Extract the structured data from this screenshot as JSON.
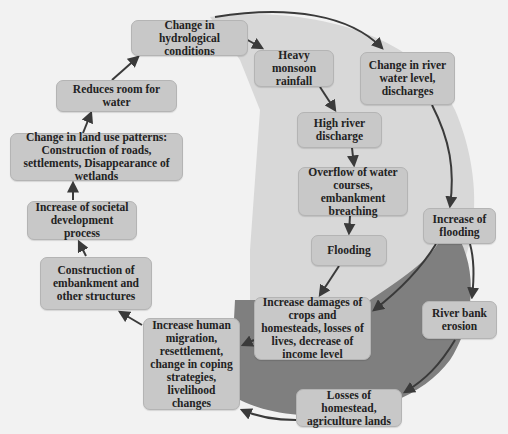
{
  "colors": {
    "background": "#f2f2f2",
    "light_region": "#d8d8d8",
    "dark_region": "#7f7f7f",
    "node_fill": "#c8c8c8",
    "arrow": "#3a3a3a"
  },
  "nodes": [
    {
      "id": "hydrological",
      "label": "Change in hydrological conditions"
    },
    {
      "id": "monsoon",
      "label": "Heavy monsoon rainfall"
    },
    {
      "id": "river_level",
      "label": "Change in river water level, discharges"
    },
    {
      "id": "reduces_room",
      "label": "Reduces room for water"
    },
    {
      "id": "high_discharge",
      "label": "High river discharge"
    },
    {
      "id": "land_use",
      "label": "Change in land use patterns: Construction of roads, settlements, Disappearance of wetlands"
    },
    {
      "id": "overflow",
      "label": "Overflow of water courses, embankment breaching"
    },
    {
      "id": "societal",
      "label": "Increase of societal development process"
    },
    {
      "id": "increase_flooding",
      "label": "Increase of flooding"
    },
    {
      "id": "flooding",
      "label": "Flooding"
    },
    {
      "id": "embankment",
      "label": "Construction of embankment and other structures"
    },
    {
      "id": "bank_erosion",
      "label": "River bank erosion"
    },
    {
      "id": "damages",
      "label": "Increase damages of crops and homesteads, losses of lives, decrease of income level"
    },
    {
      "id": "migration",
      "label": "Increase human migration, resettlement, change in coping strategies, livelihood changes"
    },
    {
      "id": "losses",
      "label": "Losses of homestead, agriculture lands"
    }
  ],
  "edges": [
    [
      "hydrological",
      "monsoon"
    ],
    [
      "hydrological",
      "river_level"
    ],
    [
      "monsoon",
      "high_discharge"
    ],
    [
      "high_discharge",
      "overflow"
    ],
    [
      "overflow",
      "flooding"
    ],
    [
      "flooding",
      "damages"
    ],
    [
      "river_level",
      "increase_flooding"
    ],
    [
      "increase_flooding",
      "damages"
    ],
    [
      "increase_flooding",
      "bank_erosion"
    ],
    [
      "bank_erosion",
      "losses"
    ],
    [
      "losses",
      "migration"
    ],
    [
      "damages",
      "migration"
    ],
    [
      "migration",
      "embankment"
    ],
    [
      "embankment",
      "societal"
    ],
    [
      "societal",
      "land_use"
    ],
    [
      "land_use",
      "reduces_room"
    ],
    [
      "reduces_room",
      "hydrological"
    ]
  ]
}
